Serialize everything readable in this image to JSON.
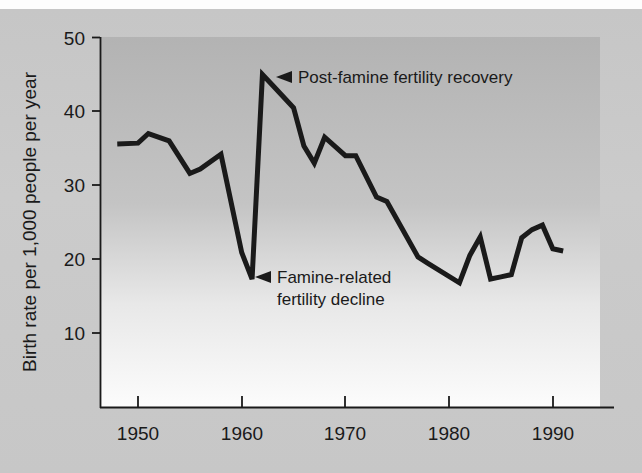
{
  "chart_data": {
    "type": "line",
    "title": "",
    "xlabel": "",
    "ylabel": "Birth rate per 1,000 people per year",
    "xlim": [
      1948,
      1992
    ],
    "ylim": [
      0,
      50
    ],
    "xticks": [
      "1950",
      "1960",
      "1970",
      "1980",
      "1990"
    ],
    "xtick_values": [
      1950,
      1960,
      1970,
      1980,
      1990
    ],
    "yticks": [
      "10",
      "20",
      "30",
      "40",
      "50"
    ],
    "ytick_values": [
      10,
      20,
      30,
      40,
      50
    ],
    "grid": false,
    "legend": "none",
    "series": [
      {
        "name": "Birth rate",
        "x": [
          1948,
          1950,
          1951,
          1953,
          1955,
          1956,
          1958,
          1960,
          1961,
          1962,
          1963,
          1965,
          1966,
          1967,
          1968,
          1970,
          1971,
          1973,
          1974,
          1977,
          1978,
          1981,
          1982,
          1983,
          1984,
          1985,
          1986,
          1987,
          1988,
          1989,
          1990,
          1991
        ],
        "values": [
          35.6,
          35.7,
          37.0,
          36.0,
          31.6,
          32.2,
          34.2,
          20.9,
          17.3,
          45.0,
          43.5,
          40.5,
          35.3,
          33.0,
          36.5,
          34.0,
          34.0,
          28.4,
          27.8,
          20.3,
          19.4,
          16.8,
          20.5,
          23.0,
          17.3,
          17.6,
          17.9,
          22.9,
          24.0,
          24.6,
          21.4,
          21.1
        ]
      }
    ],
    "annotations": [
      {
        "id": "post-famine-recovery",
        "marker": "left-arrow",
        "lines": [
          "Post-famine fertility recovery"
        ],
        "anchor_x": 1962,
        "anchor_y": 45
      },
      {
        "id": "famine-decline",
        "marker": "left-arrow",
        "lines": [
          "Famine-related",
          "fertility decline"
        ],
        "anchor_x": 1961,
        "anchor_y": 17.3
      }
    ],
    "colors": {
      "line": "#1a1a1a",
      "axis": "#1a1a1a",
      "text": "#1a1a1a",
      "plot_bg_top": "#b5b5b5",
      "plot_bg_bottom": "#fcfcfc",
      "page_bg": "#c8c8c8"
    }
  }
}
